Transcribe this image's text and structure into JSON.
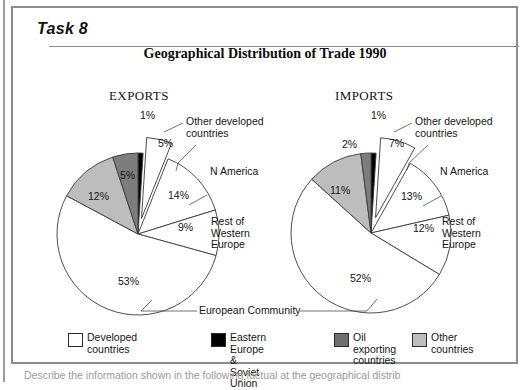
{
  "page": {
    "task_label": "Task 8",
    "footer_cut_text": "Describe the information shown in the following factual at the geographical distrib"
  },
  "chart_data": {
    "type": "pie",
    "title": "Geographical Distribution of Trade 1990",
    "panels": [
      {
        "name": "exports",
        "heading": "EXPORTS",
        "slices": [
          {
            "label": "Eastern Europe & Soviet Union",
            "value": 1,
            "value_label": "1%",
            "color": "#000000",
            "exploded": false
          },
          {
            "label": "Other developed countries",
            "value": 5,
            "value_label": "5%",
            "color": "#ffffff",
            "exploded": true
          },
          {
            "label": "N America",
            "value": 14,
            "value_label": "14%",
            "color": "#ffffff",
            "exploded": false
          },
          {
            "label": "Rest of Western Europe",
            "value": 9,
            "value_label": "9%",
            "color": "#ffffff",
            "exploded": false
          },
          {
            "label": "European Community",
            "value": 53,
            "value_label": "53%",
            "color": "#ffffff",
            "exploded": false
          },
          {
            "label": "Other countries",
            "value": 12,
            "value_label": "12%",
            "color": "#bdbdbd",
            "exploded": false
          },
          {
            "label": "Oil exporting countries",
            "value": 5,
            "value_label": "5%",
            "color": "#7d7d7d",
            "exploded": false
          }
        ],
        "callouts": [
          {
            "name": "other-developed-countries",
            "text": "Other developed\ncountries"
          },
          {
            "name": "n-america",
            "text": "N America"
          },
          {
            "name": "rest-of-western-europe",
            "text": "Rest of\nWestern\nEurope"
          }
        ]
      },
      {
        "name": "imports",
        "heading": "IMPORTS",
        "slices": [
          {
            "label": "Eastern Europe & Soviet Union",
            "value": 1,
            "value_label": "1%",
            "color": "#000000",
            "exploded": false
          },
          {
            "label": "Other developed countries",
            "value": 7,
            "value_label": "7%",
            "color": "#ffffff",
            "exploded": true
          },
          {
            "label": "N America",
            "value": 13,
            "value_label": "13%",
            "color": "#ffffff",
            "exploded": false
          },
          {
            "label": "Rest of Western Europe",
            "value": 12,
            "value_label": "12%",
            "color": "#ffffff",
            "exploded": false
          },
          {
            "label": "European Community",
            "value": 52,
            "value_label": "52%",
            "color": "#ffffff",
            "exploded": false
          },
          {
            "label": "Other countries",
            "value": 11,
            "value_label": "11%",
            "color": "#bdbdbd",
            "exploded": false
          },
          {
            "label": "Oil exporting countries",
            "value": 2,
            "value_label": "2%",
            "color": "#7d7d7d",
            "exploded": false
          }
        ],
        "callouts": [
          {
            "name": "other-developed-countries",
            "text": "Other developed\ncountries"
          },
          {
            "name": "n-america",
            "text": "N America"
          },
          {
            "name": "rest-of-western-europe",
            "text": "Rest of\nWestern\nEurope"
          }
        ]
      }
    ],
    "shared_callout": {
      "name": "european-community",
      "text": "European Community"
    },
    "legend": {
      "position": "bottom",
      "items": [
        {
          "label": "Developed countries",
          "color": "#ffffff"
        },
        {
          "label": "Eastern Europe &\nSoviet Union",
          "color": "#000000"
        },
        {
          "label": "Oil exporting\ncountries",
          "color": "#6f6f6f"
        },
        {
          "label": "Other countries",
          "color": "#bdbdbd"
        }
      ]
    }
  }
}
